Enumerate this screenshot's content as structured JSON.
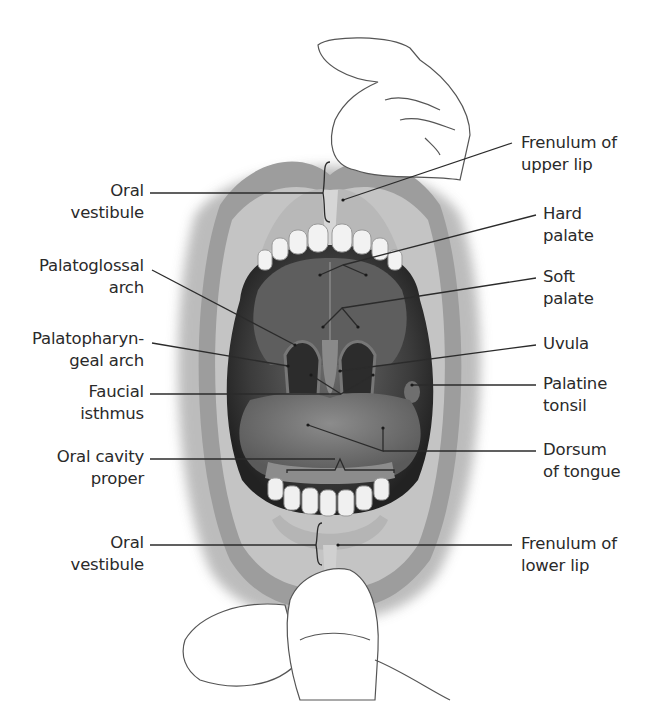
{
  "figure": {
    "colors": {
      "background": "#ffffff",
      "text": "#2a2a2a",
      "leader_line": "#2b2b2b",
      "skin_shadow": "#9a9a9a",
      "cavity_dark": "#3a3a3a"
    }
  },
  "labels": {
    "left": [
      {
        "id": "oral-vestibule-upper",
        "line1": "Oral",
        "line2": "vestibule"
      },
      {
        "id": "palatoglossal-arch",
        "line1": "Palatoglossal",
        "line2": "arch"
      },
      {
        "id": "palatopharyngeal-arch",
        "line1": "Palatopharyn-",
        "line2": "geal arch"
      },
      {
        "id": "faucial-isthmus",
        "line1": "Faucial",
        "line2": "isthmus"
      },
      {
        "id": "oral-cavity-proper",
        "line1": "Oral cavity",
        "line2": "proper"
      },
      {
        "id": "oral-vestibule-lower",
        "line1": "Oral",
        "line2": "vestibule"
      }
    ],
    "right": [
      {
        "id": "frenulum-upper-lip",
        "line1": "Frenulum of",
        "line2": "upper lip"
      },
      {
        "id": "hard-palate",
        "line1": "Hard",
        "line2": "palate"
      },
      {
        "id": "soft-palate",
        "line1": "Soft",
        "line2": "palate"
      },
      {
        "id": "uvula",
        "line1": "Uvula",
        "line2": ""
      },
      {
        "id": "palatine-tonsil",
        "line1": "Palatine",
        "line2": "tonsil"
      },
      {
        "id": "dorsum-of-tongue",
        "line1": "Dorsum",
        "line2": "of tongue"
      },
      {
        "id": "frenulum-lower-lip",
        "line1": "Frenulum of",
        "line2": "lower lip"
      }
    ]
  }
}
